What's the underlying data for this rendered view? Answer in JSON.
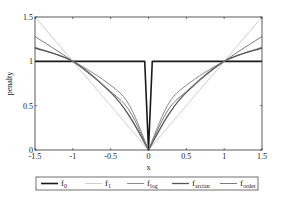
{
  "chart_data": {
    "type": "line",
    "title": "",
    "xlabel": "x",
    "ylabel": "penalty",
    "xlim": [
      -1.5,
      1.5
    ],
    "ylim": [
      0,
      1.5
    ],
    "xticks": [
      "-1.5",
      "-1",
      "-0.5",
      "0",
      "0.5",
      "1",
      "1.5"
    ],
    "yticks": [
      "0",
      "0.5",
      "1",
      "1.5"
    ],
    "grid": false,
    "legend_position": "bottom-outside",
    "series": [
      {
        "name": "f_0",
        "label_main": "f",
        "label_sub": "0",
        "color": "#1a1a1a",
        "width": 1.6,
        "x": [
          -1.5,
          -0.05,
          0,
          0.05,
          1.5
        ],
        "values": [
          1,
          1,
          0,
          1,
          1
        ]
      },
      {
        "name": "f_1",
        "label_main": "f",
        "label_sub": "1",
        "color": "#c8c8c8",
        "width": 0.9,
        "x": [
          -1.5,
          -1,
          -0.5,
          0,
          0.5,
          1,
          1.5
        ],
        "values": [
          1.5,
          1,
          0.5,
          0,
          0.5,
          1,
          1.5
        ]
      },
      {
        "name": "f_log",
        "label_main": "f",
        "label_sub": "log",
        "color": "#8a8a8a",
        "width": 1.0,
        "x": [
          -1.5,
          -1,
          -0.5,
          -0.25,
          0,
          0.25,
          0.5,
          1,
          1.5
        ],
        "values": [
          1.16,
          1,
          0.73,
          0.5,
          0,
          0.5,
          0.73,
          1,
          1.16
        ]
      },
      {
        "name": "f_arctan",
        "label_main": "f",
        "label_sub": "arctan",
        "color": "#555555",
        "width": 1.3,
        "x": [
          -1.5,
          -1,
          -0.5,
          -0.25,
          0,
          0.25,
          0.5,
          1,
          1.5
        ],
        "values": [
          1.15,
          1,
          0.65,
          0.38,
          0,
          0.38,
          0.65,
          1,
          1.15
        ]
      },
      {
        "name": "f_order",
        "label_main": "f",
        "label_sub": "order",
        "color": "#7a7a7a",
        "width": 1.0,
        "x": [
          -1.5,
          -1,
          -0.5,
          -0.25,
          0,
          0.25,
          0.5,
          1,
          1.5
        ],
        "values": [
          1.28,
          1,
          0.66,
          0.44,
          0,
          0.44,
          0.66,
          1,
          1.28
        ]
      }
    ]
  }
}
